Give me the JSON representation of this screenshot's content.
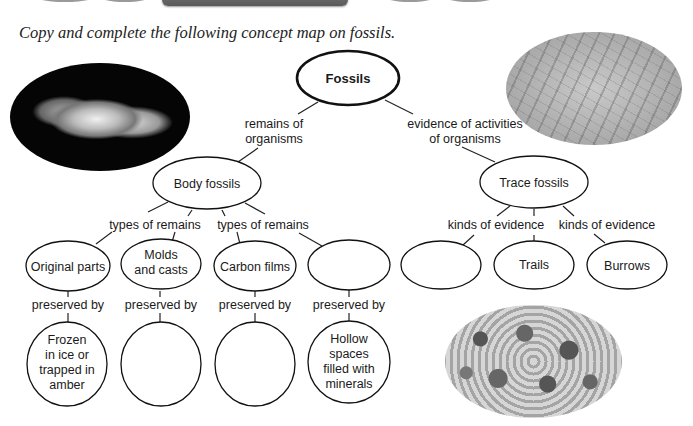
{
  "instruction": "Copy and complete the following concept map on fossils.",
  "concept_map": {
    "root": {
      "label": "Fossils"
    },
    "links_from_root": [
      {
        "line1": "remains of",
        "line2": "organisms"
      },
      {
        "line1": "evidence of activities",
        "line2": "of organisms"
      }
    ],
    "body_fossils": {
      "label": "Body fossils",
      "link_labels": [
        "types of remains",
        "types of remains"
      ],
      "children": [
        {
          "lines": [
            "Original parts"
          ],
          "preserved_by": "preserved by",
          "method_lines": [
            "Frozen",
            "in ice or",
            "trapped in",
            "amber"
          ]
        },
        {
          "lines": [
            "Molds",
            "and casts"
          ],
          "preserved_by": "preserved by",
          "method_lines": []
        },
        {
          "lines": [
            "Carbon films"
          ],
          "preserved_by": "preserved by",
          "method_lines": []
        },
        {
          "lines": [],
          "preserved_by": "preserved by",
          "method_lines": [
            "Hollow",
            "spaces",
            "filled with",
            "minerals"
          ]
        }
      ]
    },
    "trace_fossils": {
      "label": "Trace fossils",
      "link_labels": [
        "kinds of evidence",
        "kinds of evidence"
      ],
      "children": [
        {
          "label": ""
        },
        {
          "label": "Trails"
        },
        {
          "label": "Burrows"
        }
      ]
    }
  },
  "photos": [
    {
      "name": "fossil-skull-photo"
    },
    {
      "name": "trackway-photo"
    },
    {
      "name": "burrows-photo"
    }
  ]
}
